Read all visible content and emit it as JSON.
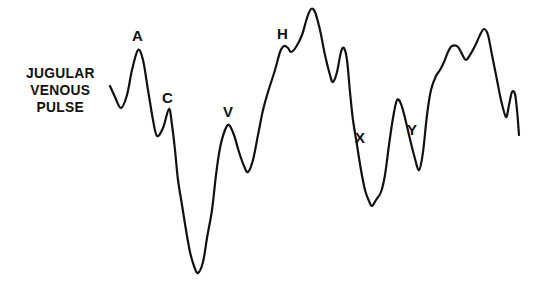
{
  "diagram": {
    "title_lines": [
      "JUGULAR",
      "VENOUS",
      "PULSE"
    ],
    "line_color": "#111111",
    "background": "#ffffff",
    "wave_labels": [
      {
        "id": "a",
        "text": "A",
        "x": 132,
        "y": 28
      },
      {
        "id": "c",
        "text": "C",
        "x": 162,
        "y": 90
      },
      {
        "id": "v",
        "text": "V",
        "x": 223,
        "y": 104
      },
      {
        "id": "h",
        "text": "H",
        "x": 277,
        "y": 26
      },
      {
        "id": "x",
        "text": "X",
        "x": 355,
        "y": 130
      },
      {
        "id": "y",
        "text": "Y",
        "x": 407,
        "y": 122
      }
    ],
    "waveform_points": [
      [
        110,
        86
      ],
      [
        115,
        97
      ],
      [
        121,
        108
      ],
      [
        127,
        95
      ],
      [
        132,
        70
      ],
      [
        138,
        50
      ],
      [
        143,
        60
      ],
      [
        148,
        90
      ],
      [
        153,
        120
      ],
      [
        157,
        136
      ],
      [
        163,
        128
      ],
      [
        169,
        109
      ],
      [
        172,
        125
      ],
      [
        175,
        150
      ],
      [
        178,
        180
      ],
      [
        182,
        205
      ],
      [
        186,
        230
      ],
      [
        190,
        252
      ],
      [
        194,
        266
      ],
      [
        198,
        273
      ],
      [
        203,
        262
      ],
      [
        207,
        238
      ],
      [
        212,
        210
      ],
      [
        216,
        175
      ],
      [
        220,
        148
      ],
      [
        225,
        130
      ],
      [
        229,
        125
      ],
      [
        234,
        135
      ],
      [
        239,
        152
      ],
      [
        244,
        166
      ],
      [
        248,
        172
      ],
      [
        253,
        160
      ],
      [
        258,
        135
      ],
      [
        263,
        110
      ],
      [
        268,
        92
      ],
      [
        275,
        70
      ],
      [
        280,
        52
      ],
      [
        284,
        46
      ],
      [
        288,
        48
      ],
      [
        291,
        52
      ],
      [
        296,
        47
      ],
      [
        302,
        35
      ],
      [
        307,
        18
      ],
      [
        311,
        9
      ],
      [
        315,
        12
      ],
      [
        320,
        30
      ],
      [
        325,
        55
      ],
      [
        330,
        75
      ],
      [
        333,
        82
      ],
      [
        337,
        72
      ],
      [
        341,
        52
      ],
      [
        344,
        48
      ],
      [
        347,
        60
      ],
      [
        350,
        92
      ],
      [
        353,
        120
      ],
      [
        357,
        145
      ],
      [
        361,
        170
      ],
      [
        365,
        190
      ],
      [
        369,
        201
      ],
      [
        372,
        206
      ],
      [
        376,
        200
      ],
      [
        381,
        192
      ],
      [
        385,
        175
      ],
      [
        389,
        145
      ],
      [
        393,
        118
      ],
      [
        397,
        100
      ],
      [
        401,
        104
      ],
      [
        405,
        118
      ],
      [
        409,
        135
      ],
      [
        414,
        155
      ],
      [
        419,
        170
      ],
      [
        423,
        152
      ],
      [
        427,
        115
      ],
      [
        431,
        90
      ],
      [
        436,
        76
      ],
      [
        440,
        70
      ],
      [
        444,
        62
      ],
      [
        448,
        52
      ],
      [
        452,
        46
      ],
      [
        458,
        47
      ],
      [
        463,
        56
      ],
      [
        466,
        60
      ],
      [
        470,
        55
      ],
      [
        475,
        46
      ],
      [
        480,
        35
      ],
      [
        484,
        29
      ],
      [
        488,
        35
      ],
      [
        492,
        55
      ],
      [
        497,
        80
      ],
      [
        501,
        100
      ],
      [
        506,
        117
      ],
      [
        509,
        105
      ],
      [
        512,
        92
      ],
      [
        515,
        94
      ],
      [
        517,
        110
      ],
      [
        519,
        135
      ]
    ]
  }
}
